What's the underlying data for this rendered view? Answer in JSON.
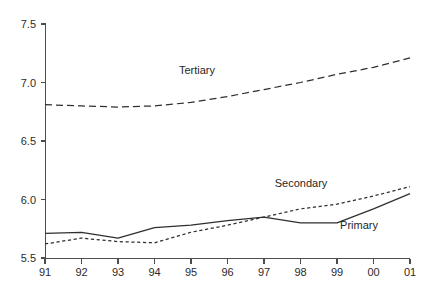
{
  "chart_data": {
    "type": "line",
    "title": "",
    "subtitle": "",
    "xlabel": "",
    "ylabel": "",
    "x": [
      "91",
      "92",
      "93",
      "94",
      "95",
      "96",
      "97",
      "98",
      "99",
      "00",
      "01"
    ],
    "xlim": [
      0,
      10
    ],
    "ylim": [
      5.5,
      7.5
    ],
    "yticks": [
      "5.5",
      "6.0",
      "6.5",
      "7.0",
      "7.5"
    ],
    "ytick_values": [
      5.5,
      6.0,
      6.5,
      7.0,
      7.5
    ],
    "xticks": [
      "91",
      "92",
      "93",
      "94",
      "95",
      "96",
      "97",
      "98",
      "99",
      "00",
      "01"
    ],
    "grid": false,
    "legend_position": "inline-annotations",
    "series": [
      {
        "name": "Tertiary",
        "style": "long-dash",
        "color": "#2f2f2f",
        "values": [
          6.81,
          6.8,
          6.79,
          6.8,
          6.83,
          6.88,
          6.94,
          7.0,
          7.07,
          7.13,
          7.21
        ],
        "label_x": "95",
        "label_value": 7.02
      },
      {
        "name": "Secondary",
        "style": "short-dash",
        "color": "#2f2f2f",
        "values": [
          5.62,
          5.67,
          5.64,
          5.63,
          5.72,
          5.78,
          5.85,
          5.92,
          5.96,
          6.03,
          6.11
        ],
        "label_x": "98",
        "label_value": 6.1
      },
      {
        "name": "Primary",
        "style": "solid",
        "color": "#2f2f2f",
        "values": [
          5.71,
          5.72,
          5.67,
          5.76,
          5.78,
          5.82,
          5.85,
          5.8,
          5.8,
          5.92,
          6.05
        ],
        "label_x": "99",
        "label_value": 5.75
      }
    ],
    "annotations": [
      {
        "text": "Tertiary",
        "x": 197,
        "y": 74
      },
      {
        "text": "Secondary",
        "x": 301,
        "y": 187
      },
      {
        "text": "Primary",
        "x": 359,
        "y": 229
      }
    ],
    "axis_color": "#4d4d4d",
    "text_color": "#2b2b2b",
    "background": "#ffffff"
  },
  "geometry": {
    "plot_left": 45,
    "plot_right": 410,
    "plot_top": 24,
    "plot_bottom": 258
  }
}
